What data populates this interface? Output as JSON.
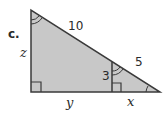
{
  "problem": {
    "part_label": "c."
  },
  "triangle": {
    "fill": "#c8c8c8",
    "stroke": "#3a3a3a",
    "labels": {
      "hypotenuse": "10",
      "altitude": "3",
      "lower_hypotenuse_segment": "5",
      "left_leg": "z",
      "base_left_segment": "y",
      "base_right_segment": "x"
    }
  }
}
